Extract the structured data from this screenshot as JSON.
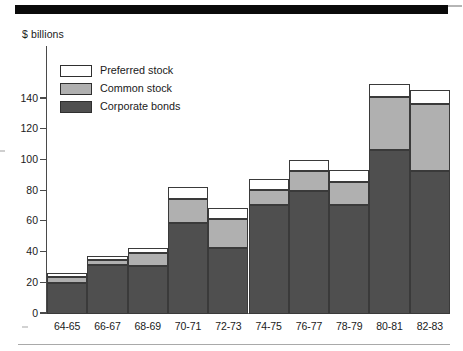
{
  "chart_data": {
    "type": "bar",
    "subtype": "stacked-column",
    "title": "",
    "xlabel": "",
    "ylabel": "$ billions",
    "ylim": [
      0,
      160
    ],
    "yticks": [
      0,
      20,
      40,
      60,
      80,
      100,
      120,
      140
    ],
    "ytick_labels": [
      "0",
      "20",
      "40",
      "60",
      "80",
      "100",
      "120",
      "140"
    ],
    "grid": false,
    "legend_position": "upper-left-inside",
    "categories": [
      "64-65",
      "66-67",
      "68-69",
      "70-71",
      "72-73",
      "74-75",
      "76-77",
      "78-79",
      "80-81",
      "82-83"
    ],
    "series": [
      {
        "name": "Corporate bonds",
        "color": "#4f4f4f",
        "values": [
          20,
          32,
          31,
          59,
          43,
          71,
          80,
          71,
          107,
          93
        ]
      },
      {
        "name": "Common stock",
        "color": "#b0b0b0",
        "values": [
          4,
          3,
          9,
          16,
          19,
          10,
          13,
          15,
          34,
          44
        ]
      },
      {
        "name": "Preferred stock",
        "color": "#ffffff",
        "values": [
          3,
          3,
          3,
          8,
          7,
          7,
          7,
          8,
          9,
          9
        ]
      }
    ],
    "cumulative_tops": {
      "Corporate bonds": [
        20,
        32,
        31,
        59,
        43,
        71,
        80,
        71,
        107,
        93
      ],
      "Common stock": [
        24,
        35,
        40,
        75,
        62,
        81,
        93,
        86,
        141,
        137
      ],
      "Preferred stock": [
        27,
        38,
        43,
        83,
        69,
        88,
        100,
        94,
        150,
        146
      ]
    }
  },
  "legend": {
    "entries": [
      {
        "label": "Preferred stock",
        "swatch": "white"
      },
      {
        "label": "Common stock",
        "swatch": "gray"
      },
      {
        "label": "Corporate bonds",
        "swatch": "dark-gray"
      }
    ]
  },
  "axis": {
    "y_title": "$ billions"
  }
}
